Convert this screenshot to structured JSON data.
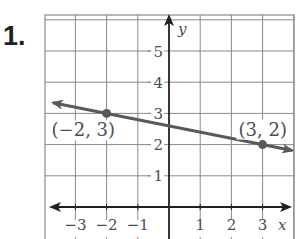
{
  "problem": {
    "number_label": "1."
  },
  "axes": {
    "x_label": "x",
    "y_label": "y",
    "x_ticks": [
      {
        "value": -3,
        "label": "−3"
      },
      {
        "value": -2,
        "label": "−2"
      },
      {
        "value": -1,
        "label": "−1"
      },
      {
        "value": 1,
        "label": "1"
      },
      {
        "value": 2,
        "label": "2"
      },
      {
        "value": 3,
        "label": "3"
      }
    ],
    "y_ticks": [
      {
        "value": 1,
        "label": "1"
      },
      {
        "value": 2,
        "label": "2"
      },
      {
        "value": 3,
        "label": "3"
      },
      {
        "value": 4,
        "label": "4"
      },
      {
        "value": 5,
        "label": "5"
      }
    ],
    "xlim": [
      -4,
      4
    ],
    "ylim": [
      0,
      6
    ]
  },
  "points": [
    {
      "x": -2,
      "y": 3,
      "label": "(−2, 3)"
    },
    {
      "x": 3,
      "y": 2,
      "label": "(3, 2)"
    }
  ],
  "line": {
    "through": [
      [
        -2,
        3
      ],
      [
        3,
        2
      ]
    ],
    "slope": -0.2,
    "arrows": "both"
  },
  "colors": {
    "grid": "#8a8a8a",
    "axis": "#231f20",
    "line": "#58595b",
    "text": "#4d4d4f"
  }
}
